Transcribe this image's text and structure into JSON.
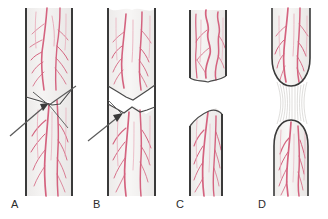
{
  "figure": {
    "background_color": "#ffffff",
    "tissue_fill": "#f0efee",
    "tissue_fill_light": "#f6f5f4",
    "sheath_color": "#3a3a3a",
    "cut_edge_color": "#4a4a4a",
    "vessel_color": "#d4637f",
    "vessel_color_dark": "#b8425f",
    "vessel_color_pale": "#e8a8b8",
    "arrow_color": "#5a5a5a",
    "fiber_color": "#c9c7c5"
  },
  "panels": [
    {
      "id": "A",
      "label": "A",
      "description": "Oblique transection with stumps in apposition",
      "has_arrow": true,
      "arrow_target": "oblique cut line",
      "arrow_from": [
        10,
        136
      ],
      "arrow_to": [
        47,
        104
      ],
      "gap": "none"
    },
    {
      "id": "B",
      "label": "B",
      "description": "Jagged transection with separated wedge-shaped stumps",
      "has_arrow": true,
      "arrow_target": "jagged cut edge",
      "arrow_from": [
        88,
        140
      ],
      "arrow_to": [
        122,
        115
      ],
      "gap": "small"
    },
    {
      "id": "C",
      "label": "C",
      "description": "Retracted stumps with wide gap and coiled vessels",
      "has_arrow": false,
      "gap": "wide"
    },
    {
      "id": "D",
      "label": "D",
      "description": "Stretch avulsion injury with bulbous ends joined by thin fibers",
      "has_arrow": false,
      "gap": "stretched fibers"
    }
  ],
  "labels": {
    "a": "A",
    "b": "B",
    "c": "C",
    "d": "D"
  }
}
